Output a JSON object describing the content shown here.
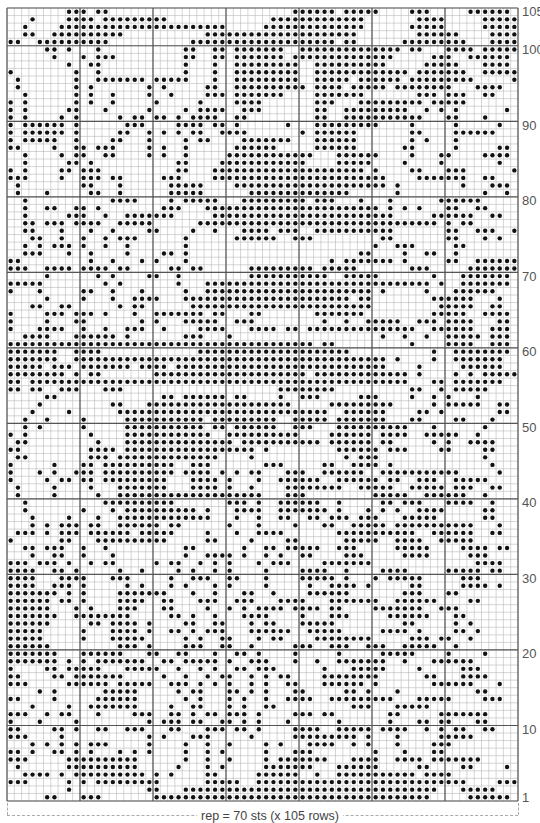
{
  "chart_data": {
    "type": "heatmap",
    "title": "",
    "columns": 70,
    "rows": 105,
    "row_order": "top-to-bottom, first string is row 105, last is row 1",
    "symbol_legend": {
      "#": "dot (contrast color)",
      ".": "blank (main color)"
    },
    "row_labels": [
      "105",
      "100",
      "90",
      "80",
      "70",
      "60",
      "50",
      "40",
      "30",
      "20",
      "10",
      "1"
    ],
    "row_label_values": [
      105,
      100,
      90,
      80,
      70,
      60,
      50,
      40,
      30,
      20,
      10,
      1
    ],
    "caption": "rep = 70 sts (x 105 rows)",
    "grid": [
      "........###.##.........................######.#####....###.....######.",
      "...#....####.#########..............#############.......####.....######",
      "..#....#######################.....##############......#####.....######",
      "..##..##########...........#####################........######....#####",
      "##..##########...........####################.##......#########...####.",
      ".....##.#...#...........##..##.#######..##############.##...####.#####.",
      "......#...#.###.........##..##.#######.##############.....###..######.",
      "........#..##...........#...#..#########..##########.....#####...####.",
      "#........#..#...........#...#..#########..#############.#######..#####.",
      ".#.......#..#######.#####...#..#########..#####.######.#########.....##",
      ".#.......#.#.......#.#.....##..##########.####.#####.########...####..",
      "..#......#.#..#....#..#....###.#######....#######.......###.###..##....",
      "#.#......#.#..#.....#.....#....####.......###...#########.#####.......#",
      "#.#.....##...#.....#....#.####..###.......##..#########..#.#.#......#..",
      "#.#....#.#.....#.##.##.#.####..##.........##..###########...##...#.....",
      "#.######.#......###....####.##.#......#...#########....#.....#.....#..",
      "#.######.#.....##..#.#.#.##..####.......#.######.......##....######..",
      "#.#####..#....##...#....#.##....#######...######.......#.#...#.......",
      "##....#..##.###....#.#..#......######.....######......##.....#.....##.",
      "..#....#.##..##....#.#..#.....############...######....#...##....####.",
      "..#.....##.#...........##....############....#####....#....#.......#..",
      "#.#....##.###..........##...#####################.#....##...###......#",
      "###....#..###.##.....###....########################....#######..##...",
      ".#........##...#......#####....#####################.#........#...###.",
      ".#...#.....##..#......#####......##############......#...........#..#.",
      "..#...........####....#.#####...#########.###...#...#......######....",
      "..#..##..##.#........###...########################.#.#.#...##..##...",
      "..#.....###..#..#######.....#########################.....######..##.",
      "..##.###.####..#####......#################################.#.##......",
      "..##...#...#..#....##....#..#...####.###..###########.......##..###..#",
      "...##..#..#..#.###......#......######..###.........##.......##...#.#.",
      "..#.#.###.#..#..#.......#.........................#..###.....##.......",
      "..###...#..#....#....##.#.......................##....#..##..#........#",
      "##.........#..#...#.#...#...................#.#######.#.....##..######",
      "###..####.####.##.....##.##......#########.#####.......###.....#######",
      ".....#......#.#....##..#.........###########..#####.......#...#######.",
      "#####........#.#.......#...###############################.#..#######",
      "#...#.....##..#...#.....#..#######################.#.....#...######.",
      ".....#....#...#..####...#######################.##........######...#..",
      "...##..##......#.##......#########################.........#####..##..",
      "#....###.###.#...#..#######.##...##.......#######.........#####..####.",
      "#....#...##.......#.#...#####..###.........#..#..#####..###.####...##",
      "#...####..#..#..###..#....####...####.##.###############..######..###",
      "..####...######.#.......###...#....................#..#..#..#####.###.",
      "##########################################.##..........#....####..###",
      "#######..####.............#####################...........#..########",
      "#######..###########################################.#....#..#######.",
      "#####.###.#######.####.#############################....#.....######.",
      "########.#.##.......#####################.#############.#....#.#.#####",
      "##.####################################################...##.#######.",
      "##.##..###...###.....................########..........##..#.#####..",
      ".....##..............##.######.##....#..###.....###....#..#.#...#..",
      "....#.........##...####################.....#########.....#.#####..##",
      "...#....#......#############################..######....##.#.......##",
      "..#..#....#.....###########.#########..#####.#######...##....##...#.",
      "..#.#.....#.....###########.##.######..###...##########...#......#..",
      "#.#........#....############..##########....######.####..#####..#...",
      ".##.........#...###############.###########.######.##.....#.#..####.",
      "##.........####.##################.#.........######.###....##....##..",
      ".##........###.##############....#............#.###..............#..",
      "#.....#...##.##########..###.......###.....##..####.#.............#.",
      "#...#.#..###.##########.####.#.#.##...###..######..###########.....#",
      "#....#.##.##.#########...####.#...#..######..######.##..###..#####..",
      ".#....#....#...#######...####.#..#....########..#####..#####.###..##",
      ".#....#.....#..####################...###.........#####..######..#..",
      "..#..........##########.......###.#..######..#.....##.###...####..#..",
      "..#.......#...#.##########.#...####..#######.#...#.#.#..####.....##.",
      "...#....#...#..#############...#..#..##..##.###.###...#####......##.",
      "...#.#.###.##..######.##......#...#....#...##..#####.###########...#",
      ".###.#.###.######.#####....#...#..####.......###########..######..##",
      "#......##...##########.....##....#....##......#####..####..#####...",
      "..##.###..#..#..........##......#..##.#####..###.....#####....####.##",
      "...#..##..#...#.........#..####.#..#.#..##....###.....####.....###..",
      "###.###.#..#.##.....#.##..#.#.#...#.###....#######..............####.",
      "####..##.#.....#..#....#.#..#.#....#....####..#....####.....#####.##",
      "####...####...###.....#..###..##...#....#####.#...#.#####.....###....",
      "####..###.#.....#.#...#.#...#.#....#.....#..####.#.....##.....####.#.",
      "#######.#.#....#######...#..#...##..#....######.......###...##.....",
      "######.##.#....####..##...###..###...####...#######..######....##.",
      "######...#.#...###...##....#..#.#.####.####.##....#######..###.....",
      "#######..########.....##.#..#...####....#...###.....######...##....",
      "######.....##.####.#....##..##...#.##...#####.........##.....#.#...",
      "#####.....#...####.#..##.#.###...######..#####.....####.#....##.#..",
      "#####.....#...#####.....#.#..##...#.##....########.....###.##..#...",
      "######.........###.#....###..##..#.....###..###..###..#####..#.....",
      "#######...######...##..##...#..##.#....#.....#.....#####....#....#.",
      "#######.#.#.#######..##.#####.#..###...#..#..#######..#...######...",
      "#....##.#####...#####..#..#.#..##.###......#...#####....#.....###..",
      "##....##.#######.....#..#..#.##..#.#.##....########......##...####..",
      "###.....######.#####..###.#.#.#..#.#..##...######.#.......######...#",
      "....#.#......#####.....#.##...##.#.#...##.....##.#...#..........##.",
      "##....#.....######......#.#...#.#..#..####..#########...#####....###",
      "...#....#..#######....#..##...#.#..##..........###...#####...........",
      "###..#.##...#....###..##.#.##.###.#....###.##.......##.....#######..",
      "#...#....#.........#.###.##..##.#.#...#......#......#...##.##...##..",
      "##....##.#..##..###...##...###.##.#....####..#####.####..#.#.##..##.",
      "###....#...........#.#...###.....#.....#########.#...#.....#####...",
      "...#.#.#.#.###.....#....#..#..#....#.#...####..#.#...#....###......",
      "##.#..##.#.#...#.#.#....#..#.#.....#...###........#...#...##.......",
      "###.....##########......#..#..#....#.#######...####..####.#######.",
      ".#......##########.....#...#.#.....#######...######.....##....##....#",
      "..####.#.##########.#.#....##.....######..#..###########.####.......",
      "###.....#.#.#########......#####..#############################....###",
      "........#..........##...###################################...#####..",
      ".....##...###.......######################################.....######."
    ]
  }
}
